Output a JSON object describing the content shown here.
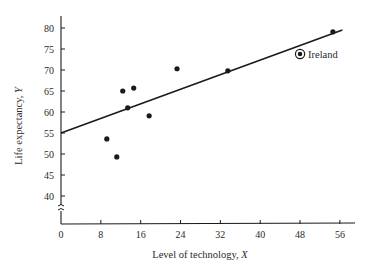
{
  "chart_data": {
    "type": "scatter",
    "title": "",
    "xlabel": "Level of technology, X",
    "ylabel": "Life expectancy, Y",
    "xlim": [
      0,
      58
    ],
    "ylim": [
      35,
      83
    ],
    "y_axis_break": true,
    "x_ticks": [
      0,
      8,
      16,
      24,
      32,
      40,
      48,
      56
    ],
    "y_ticks": [
      40,
      45,
      50,
      55,
      60,
      65,
      70,
      75,
      80
    ],
    "grid": false,
    "legend": null,
    "series": [
      {
        "name": "Countries",
        "marker": "filled-circle",
        "points": [
          {
            "x": 9.2,
            "y": 53.6
          },
          {
            "x": 11.2,
            "y": 49.3
          },
          {
            "x": 12.4,
            "y": 65.0
          },
          {
            "x": 13.4,
            "y": 61.0
          },
          {
            "x": 14.6,
            "y": 65.7
          },
          {
            "x": 17.7,
            "y": 59.1
          },
          {
            "x": 23.3,
            "y": 70.3
          },
          {
            "x": 33.5,
            "y": 69.8
          },
          {
            "x": 54.6,
            "y": 79.1
          }
        ]
      },
      {
        "name": "Ireland",
        "marker": "circled-dot",
        "points": [
          {
            "x": 48.0,
            "y": 73.8
          }
        ]
      }
    ],
    "regression_line": {
      "intercept": 55.0,
      "slope": 0.434,
      "x_start": 0,
      "x_end": 56.5
    },
    "annotations": [
      {
        "text": "Ireland",
        "x": 48.0,
        "y": 73.8
      }
    ]
  },
  "labels": {
    "xlabel": "Level of technology, X",
    "ylabel": "Life expectancy, Y",
    "ireland": "Ireland",
    "x_ticks": [
      "0",
      "8",
      "16",
      "24",
      "32",
      "40",
      "48",
      "56"
    ],
    "y_ticks": [
      "40",
      "45",
      "50",
      "55",
      "60",
      "65",
      "70",
      "75",
      "80"
    ]
  },
  "colors": {
    "ink": "#1a1a1a",
    "text": "#2a2a2a",
    "background": "#ffffff"
  }
}
